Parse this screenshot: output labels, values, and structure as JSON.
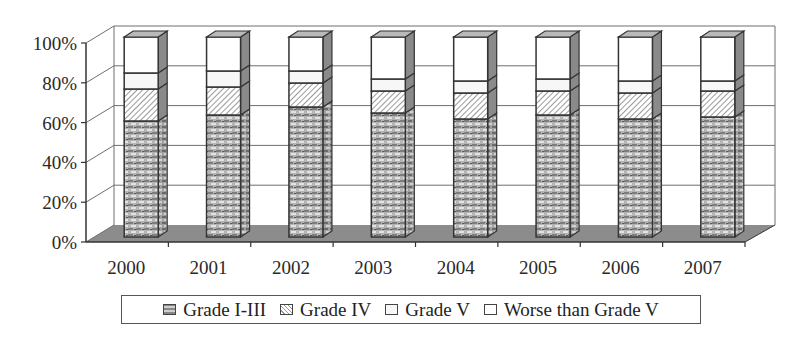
{
  "chart_data": {
    "type": "bar",
    "stacked": true,
    "percent_stacked": true,
    "three_d": true,
    "title": "",
    "xlabel": "",
    "ylabel": "",
    "categories": [
      "2000",
      "2001",
      "2002",
      "2003",
      "2004",
      "2005",
      "2006",
      "2007"
    ],
    "series": [
      {
        "name": "Grade I-III",
        "values": [
          58,
          61,
          65,
          62,
          59,
          61,
          59,
          60
        ]
      },
      {
        "name": "Grade IV",
        "values": [
          16,
          14,
          12,
          11,
          13,
          12,
          13,
          13
        ]
      },
      {
        "name": "Grade V",
        "values": [
          8,
          8,
          6,
          6,
          6,
          6,
          6,
          5
        ]
      },
      {
        "name": "Worse than Grade V",
        "values": [
          18,
          17,
          17,
          21,
          22,
          21,
          22,
          22
        ]
      }
    ],
    "yticks": [
      "0%",
      "20%",
      "40%",
      "60%",
      "80%",
      "100%"
    ],
    "ylim": [
      0,
      100
    ],
    "grid": true,
    "legend_position": "bottom"
  },
  "legend": {
    "items": [
      {
        "label": "Grade I-III",
        "swatch": "grade13"
      },
      {
        "label": "Grade IV",
        "swatch": "grade4"
      },
      {
        "label": "Grade V",
        "swatch": "grade5"
      },
      {
        "label": "Worse than Grade V",
        "swatch": "worse"
      }
    ]
  },
  "colors": {
    "floor": "#8c8c8c",
    "side": "#7a7a7a",
    "top": "#b9b9b9",
    "grid": "#6e6e6e",
    "axis": "#333333"
  }
}
